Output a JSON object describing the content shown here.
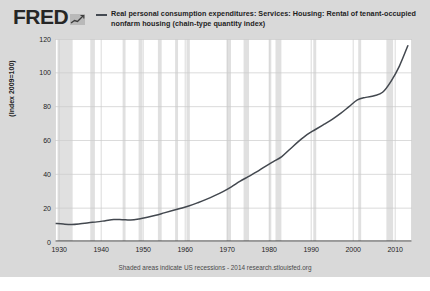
{
  "brand": {
    "wordmark": "FRED",
    "logo_icon": "mini-line-chart-icon"
  },
  "legend": {
    "swatch_color": "#444a52",
    "label": "Real personal consumption expenditures: Services: Housing: Rental of tenant-occupied nonfarm housing (chain-type quantity index)"
  },
  "footer": {
    "note": "Shaded areas indicate US recessions - 2014 research.stlouisfed.org"
  },
  "colors": {
    "widget_background": "#d9d9d9",
    "plot_background": "#ffffff",
    "gridline": "#cccccc",
    "series_line": "#43484f",
    "recession_band": "#e0e0e0",
    "axis": "#333333"
  },
  "chart_data": {
    "type": "line",
    "title": "",
    "subtitle": "",
    "xlabel": "",
    "ylabel": "(Index 2009=100)",
    "xlim": [
      1929,
      2014
    ],
    "ylim": [
      0,
      120
    ],
    "grid": true,
    "legend_position": "top",
    "xticks": [
      1930,
      1940,
      1950,
      1960,
      1970,
      1980,
      1990,
      2000,
      2010
    ],
    "yticks": [
      0,
      20,
      40,
      60,
      80,
      100,
      120
    ],
    "series": [
      {
        "name": "Real personal consumption expenditures: Services: Housing: Rental of tenant-occupied nonfarm housing (chain-type quantity index)",
        "color": "#43484f",
        "x": [
          1929,
          1931,
          1933,
          1935,
          1937,
          1939,
          1941,
          1943,
          1945,
          1947,
          1949,
          1951,
          1953,
          1955,
          1957,
          1959,
          1961,
          1963,
          1965,
          1967,
          1969,
          1971,
          1973,
          1975,
          1977,
          1979,
          1981,
          1983,
          1985,
          1987,
          1989,
          1991,
          1993,
          1995,
          1997,
          1999,
          2001,
          2003,
          2005,
          2007,
          2009,
          2011,
          2013
        ],
        "y": [
          11.0,
          10.6,
          10.4,
          10.8,
          11.4,
          11.9,
          12.6,
          13.3,
          13.2,
          13.0,
          13.6,
          14.6,
          15.8,
          17.2,
          18.6,
          20.0,
          21.4,
          23.2,
          25.2,
          27.4,
          29.8,
          32.6,
          35.8,
          38.6,
          41.4,
          44.6,
          47.5,
          50.5,
          55.0,
          59.5,
          63.5,
          66.5,
          69.5,
          72.5,
          76.0,
          80.0,
          84.0,
          85.5,
          86.5,
          88.5,
          95.0,
          104.0,
          116.0
        ]
      }
    ],
    "recessions": [
      {
        "start": 1929.6,
        "end": 1933.2
      },
      {
        "start": 1937.4,
        "end": 1938.5
      },
      {
        "start": 1945.1,
        "end": 1945.8
      },
      {
        "start": 1948.9,
        "end": 1949.8
      },
      {
        "start": 1953.5,
        "end": 1954.4
      },
      {
        "start": 1957.6,
        "end": 1958.3
      },
      {
        "start": 1960.3,
        "end": 1961.1
      },
      {
        "start": 1969.9,
        "end": 1970.9
      },
      {
        "start": 1973.9,
        "end": 1975.2
      },
      {
        "start": 1980.0,
        "end": 1980.5
      },
      {
        "start": 1981.5,
        "end": 1982.9
      },
      {
        "start": 1990.5,
        "end": 1991.2
      },
      {
        "start": 2001.2,
        "end": 2001.9
      },
      {
        "start": 2007.9,
        "end": 2009.5
      }
    ]
  }
}
